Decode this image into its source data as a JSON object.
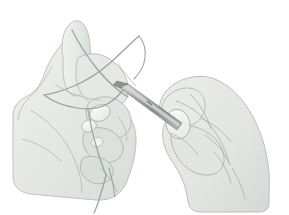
{
  "illustration": {
    "title": "Instrument tie — suture knot being formed between two gloved hands",
    "domain": "medical-surgical-technique-illustration",
    "medium": "grayscale line and wash drawing",
    "background_color": "#ffffff",
    "canvas": {
      "width": 289,
      "height": 215
    },
    "palette": {
      "background": "#ffffff",
      "skin_fill_light": "#eceeec",
      "skin_fill_mid": "#e3e6e3",
      "skin_fill_shadow": "#d6dad7",
      "skin_fill_deep_shadow": "#c9cecb",
      "outline_soft": "#b9bfbb",
      "outline_mid": "#a8afaa",
      "crease_line": "#9aa39d",
      "suture_thread": "#9ba39e",
      "suture_thread_light": "#b6bdb8",
      "instrument_body": "#9aa09c",
      "instrument_highlight": "#ced3d0",
      "instrument_dark": "#7e857f",
      "nail_fill": "#f4f5f3",
      "nail_outline": "#b0b7b2"
    },
    "subjects": [
      {
        "name": "left-hand",
        "label": "Left hand",
        "description": "Left hand seen from the ulnar side, fingers curled into a loose fist with the index finger extended up and to the right; suture thread is looped around the fingers.",
        "position": "left half of image",
        "visible_features": [
          "extended index finger",
          "curled middle finger",
          "curled ring finger",
          "thumb web",
          "wrist and forearm exiting lower-left",
          "three visible fingernails",
          "palm creases"
        ]
      },
      {
        "name": "right-hand",
        "label": "Right hand",
        "description": "Right hand seen from the dorsal side, gripping a needle holder; thumb and index finger pinch the instrument handle.",
        "position": "right half of image",
        "visible_features": [
          "thumb with fingernail",
          "index finger",
          "knuckle creases",
          "dorsal tendon lines",
          "wrist exiting lower-right"
        ]
      },
      {
        "name": "needle-holder",
        "label": "Needle holder / forceps",
        "description": "Straight metallic instrument angled down-right, jaws toward upper-left, held between the right thumb and index finger; it crosses in front of the left hand.",
        "orientation": "diagonal, upper-left to lower-right",
        "material": "polished stainless steel"
      },
      {
        "name": "suture-thread",
        "label": "Suture thread",
        "description": "Fine monofilament suture looping over the extended left index finger, crossing itself above the left hand, wrapping around the curled fingers, and trailing down below the left hand as a free tail.",
        "segments": [
          "loop over extended index finger",
          "crossing strand descending right to left",
          "wrap around middle phalanges",
          "strand passing to the instrument jaws",
          "free tail hanging below the hand"
        ]
      }
    ],
    "annotations": {
      "labels": [],
      "arrows": [],
      "numbers": [],
      "caption": ""
    }
  }
}
